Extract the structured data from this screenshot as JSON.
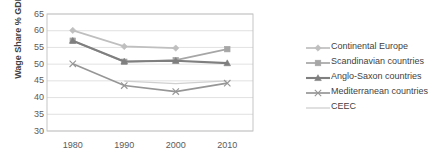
{
  "chart_data": {
    "type": "line",
    "title": "",
    "xlabel": "",
    "ylabel": "Wage Share % GDP",
    "x": [
      1980,
      1990,
      2000,
      2010
    ],
    "xticklabels": [
      "1980",
      "1990",
      "2000",
      "2010"
    ],
    "yticklabels": [
      "30",
      "35",
      "40",
      "45",
      "50",
      "55",
      "60",
      "65"
    ],
    "yticks": [
      30,
      35,
      40,
      45,
      50,
      55,
      60,
      65
    ],
    "ylim": [
      30,
      65
    ],
    "grid": true,
    "legend_position": "right",
    "series": [
      {
        "name": "Continental Europe",
        "marker": "diamond",
        "color": "#bfbfbf",
        "x": [
          1980,
          1990,
          2000
        ],
        "values": [
          60.1,
          55.3,
          54.8
        ]
      },
      {
        "name": "Scandinavian countries",
        "marker": "square",
        "color": "#a6a6a6",
        "x": [
          1980,
          1990,
          2000,
          2010
        ],
        "values": [
          57.0,
          50.7,
          51.2,
          54.5
        ]
      },
      {
        "name": "Anglo-Saxon countries",
        "marker": "triangle",
        "color": "#7f7f7f",
        "x": [
          1980,
          1990,
          2000,
          2010
        ],
        "values": [
          57.0,
          50.8,
          51.0,
          50.3
        ]
      },
      {
        "name": "Mediterranean countries",
        "marker": "x",
        "color": "#969696",
        "x": [
          1980,
          1990,
          2000,
          2010
        ],
        "values": [
          50.1,
          43.6,
          41.8,
          44.3
        ]
      },
      {
        "name": "CEEC",
        "marker": "none",
        "color": "#d0d0d0",
        "x": [
          1990,
          2000,
          2010
        ],
        "values": [
          44.9,
          44.2,
          45.0
        ]
      }
    ]
  },
  "legend": {
    "items": [
      {
        "label": "Continental Europe"
      },
      {
        "label": "Scandinavian countries"
      },
      {
        "label": "Anglo-Saxon countries"
      },
      {
        "label": "Mediterranean countries"
      },
      {
        "label": "CEEC"
      }
    ]
  },
  "colors": {
    "grid": "#d9d9d9",
    "axis": "#bfbfbf",
    "text": "#5a5a5a",
    "title_text": "#3f3f3f"
  }
}
